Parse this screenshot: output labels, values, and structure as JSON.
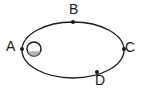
{
  "diagram": {
    "type": "orbit-ellipse",
    "background_color": "#ffffff",
    "stroke_color": "#1a1a1a",
    "ellipse": {
      "center_x": 73,
      "center_y": 50,
      "semi_major_axis": 51,
      "semi_minor_axis": 28,
      "stroke_width": 1.3
    },
    "star": {
      "name": "central-body",
      "center_x": 34,
      "center_y": 49,
      "radius": 7,
      "fill_color": "#ffffff",
      "stroke_color": "#1a1a1a",
      "shade_color": "#a8a8a8"
    },
    "points": [
      {
        "id": "A",
        "label": "A",
        "x": 22,
        "y": 49,
        "label_x": 6,
        "label_y": 39
      },
      {
        "id": "B",
        "label": "B",
        "x": 73,
        "y": 22,
        "label_x": 69,
        "label_y": 2
      },
      {
        "id": "C",
        "label": "C",
        "x": 124,
        "y": 49,
        "label_x": 125,
        "label_y": 40
      },
      {
        "id": "D",
        "label": "D",
        "x": 97,
        "y": 72,
        "label_x": 95,
        "label_y": 73
      }
    ],
    "marker_radius": 2
  }
}
